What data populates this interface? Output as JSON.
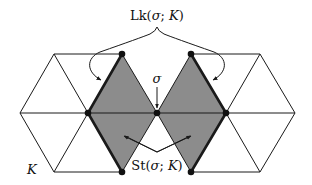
{
  "diagram": {
    "labels": {
      "link_prefix": "Lk(",
      "link_sigma": "σ",
      "link_sep": "; ",
      "link_K": "K",
      "link_suffix": ")",
      "star_prefix": "St(",
      "star_sigma": "σ",
      "star_sep": "; ",
      "star_K": "K",
      "star_suffix": ")",
      "sigma": "σ",
      "complex": "K"
    },
    "colors": {
      "star_fill": "#8c8c8c",
      "line": "#1a1a1a",
      "background": "#ffffff"
    }
  }
}
